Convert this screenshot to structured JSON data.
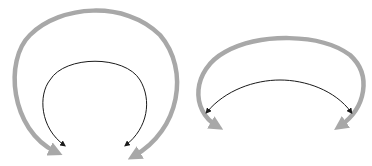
{
  "diagram": {
    "colors": {
      "background": "#ffffff",
      "outer_arrow": "#a8a8a8",
      "inner_arrow": "#1a1a1a"
    },
    "groups": [
      {
        "name": "left-arc-group",
        "outer_arrow": {
          "type": "double-ended-curved-arrow",
          "color": "#a8a8a8",
          "stroke_width": 4.5
        },
        "inner_arrow": {
          "type": "double-ended-curved-arrow",
          "color": "#1a1a1a",
          "stroke_width": 1
        }
      },
      {
        "name": "right-arc-group",
        "outer_arrow": {
          "type": "double-ended-curved-arrow",
          "color": "#a8a8a8",
          "stroke_width": 4.5
        },
        "inner_arrow": {
          "type": "double-ended-curved-arrow",
          "color": "#1a1a1a",
          "stroke_width": 1
        }
      }
    ]
  }
}
